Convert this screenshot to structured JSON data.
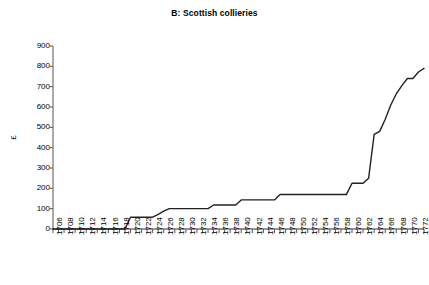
{
  "chart_data": {
    "type": "line",
    "title": "B: Scottish collieries",
    "xlabel": "",
    "ylabel": "£",
    "ylim": [
      0,
      900
    ],
    "xlim": [
      1706,
      1773
    ],
    "y_ticks": [
      0,
      100,
      200,
      300,
      400,
      500,
      600,
      700,
      800,
      900
    ],
    "grid": false,
    "legend": "none",
    "x_tick_labels": [
      "1706",
      "1708",
      "1710",
      "1712",
      "1714",
      "1716",
      "1718",
      "1720",
      "1722",
      "1724",
      "1726",
      "1728",
      "1730",
      "1732",
      "1734",
      "1736",
      "1738",
      "1740",
      "1742",
      "1744",
      "1746",
      "1748",
      "1750",
      "1752",
      "1754",
      "1756",
      "1758",
      "1760",
      "1762",
      "1764",
      "1766",
      "1768",
      "1770",
      "1772"
    ],
    "x_tick_label_step": 2,
    "minor_tick_step": 1,
    "series": [
      {
        "name": "Scottish collieries",
        "color": "#222222",
        "x": [
          1706,
          1707,
          1708,
          1709,
          1710,
          1711,
          1712,
          1713,
          1714,
          1715,
          1716,
          1717,
          1718,
          1719,
          1720,
          1721,
          1722,
          1723,
          1724,
          1725,
          1726,
          1727,
          1728,
          1729,
          1730,
          1731,
          1732,
          1733,
          1734,
          1735,
          1736,
          1737,
          1738,
          1739,
          1740,
          1741,
          1742,
          1743,
          1744,
          1745,
          1746,
          1747,
          1748,
          1749,
          1750,
          1751,
          1752,
          1753,
          1754,
          1755,
          1756,
          1757,
          1758,
          1759,
          1760,
          1761,
          1762,
          1763,
          1764,
          1765,
          1766,
          1767,
          1768,
          1769,
          1770,
          1771,
          1772,
          1773
        ],
        "values": [
          0,
          0,
          0,
          0,
          0,
          0,
          0,
          0,
          0,
          0,
          0,
          0,
          0,
          0,
          58,
          58,
          58,
          58,
          58,
          72,
          88,
          100,
          100,
          100,
          100,
          100,
          100,
          100,
          100,
          118,
          118,
          118,
          118,
          118,
          143,
          143,
          143,
          143,
          143,
          143,
          143,
          170,
          170,
          170,
          170,
          170,
          170,
          170,
          170,
          170,
          170,
          170,
          170,
          170,
          225,
          225,
          225,
          250,
          465,
          480,
          540,
          610,
          665,
          705,
          740,
          740,
          772,
          790
        ]
      }
    ]
  }
}
